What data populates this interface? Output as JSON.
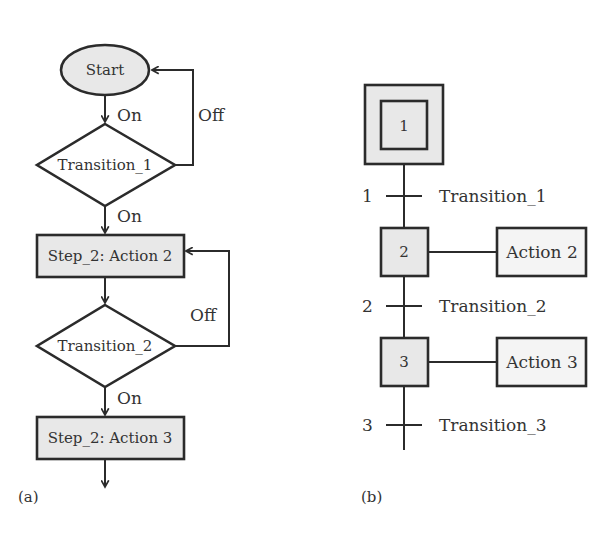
{
  "colors": {
    "fill": "#e8e8e8",
    "stroke": "#2b2b2b",
    "text": "#333333",
    "background": "#ffffff"
  },
  "panel_a": {
    "caption": "(a)",
    "start": {
      "label": "Start"
    },
    "transition_1": {
      "label": "Transition_1",
      "on_label": "On",
      "off_label": "Off"
    },
    "start_on_label": "On",
    "step_2": {
      "label": "Step_2: Action 2"
    },
    "transition_2": {
      "label": "Transition_2",
      "on_label": "On",
      "off_label": "Off"
    },
    "step_3": {
      "label": "Step_2: Action 3"
    }
  },
  "panel_b": {
    "caption": "(b)",
    "steps": [
      {
        "number": "1",
        "initial": true
      },
      {
        "number": "2",
        "action": "Action 2"
      },
      {
        "number": "3",
        "action": "Action 3"
      }
    ],
    "transitions": [
      {
        "number": "1",
        "label": "Transition_1"
      },
      {
        "number": "2",
        "label": "Transition_2"
      },
      {
        "number": "3",
        "label": "Transition_3"
      }
    ]
  }
}
